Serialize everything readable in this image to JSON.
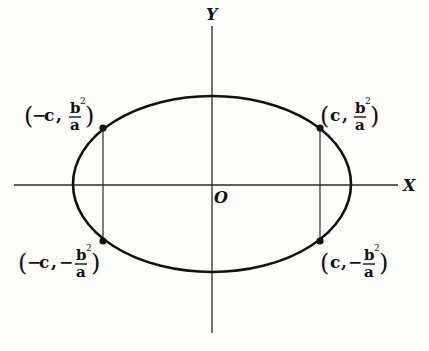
{
  "diagram": {
    "title": "",
    "axes": {
      "x_label": "X",
      "y_label": "Y",
      "origin_label": "O"
    },
    "ellipse": {
      "center": [
        0,
        0
      ],
      "semi_major_axis": "a",
      "semi_minor_axis": "b",
      "focal_distance": "c"
    },
    "points": [
      {
        "id": "top-left",
        "label_open": "(",
        "label_sign_x": "−",
        "label_x": "c",
        "label_sep": ",",
        "label_sign_y": "",
        "num": "b",
        "sup": "2",
        "den": "a",
        "label_close": ")",
        "full": "(−c, b²/a)"
      },
      {
        "id": "top-right",
        "label_open": "(",
        "label_sign_x": "",
        "label_x": "c",
        "label_sep": ",",
        "label_sign_y": "",
        "num": "b",
        "sup": "2",
        "den": "a",
        "label_close": ")",
        "full": "(c, b²/a)"
      },
      {
        "id": "bottom-left",
        "label_open": "(",
        "label_sign_x": "−",
        "label_x": "c",
        "label_sep": ",",
        "label_sign_y": "−",
        "num": "b",
        "sup": "2",
        "den": "a",
        "label_close": ")",
        "full": "(−c, −b²/a)"
      },
      {
        "id": "bottom-right",
        "label_open": "(",
        "label_sign_x": "",
        "label_x": "c",
        "label_sep": ",",
        "label_sign_y": "−",
        "num": "b",
        "sup": "2",
        "den": "a",
        "label_close": ")",
        "full": "(c, −b²/a)"
      }
    ],
    "chords": [
      {
        "name": "latus-rectum-left",
        "x": "−c"
      },
      {
        "name": "latus-rectum-right",
        "x": "c"
      }
    ]
  }
}
